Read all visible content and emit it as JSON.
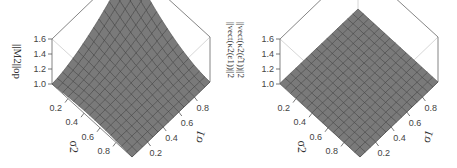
{
  "chart_data": [
    {
      "type": "surface3d",
      "title": "",
      "zlabel": "||M2||op",
      "xlabel": "σ1",
      "ylabel": "σ2",
      "x_ticks": [
        "0.2",
        "0.4",
        "0.6",
        "0.8"
      ],
      "y_ticks": [
        "0.2",
        "0.4",
        "0.6",
        "0.8"
      ],
      "z_ticks": [
        "1.0",
        "1.2",
        "1.4",
        "1.6"
      ],
      "zlim": [
        1.0,
        1.6
      ],
      "grid_size": 15,
      "description": "Surface rises to ~1.6 at corner where σ1 high and σ2 low; ~1.0 elsewhere with a saddle-like dip",
      "corner_values": {
        "s1_low_s2_low": 1.05,
        "s1_high_s2_low": 1.6,
        "s1_low_s2_high": 1.0,
        "s1_high_s2_high": 1.0
      }
    },
    {
      "type": "surface3d",
      "title": "",
      "zlabel": "||vect(κ2(ε1))||2 / ||vect(κ2(ε̂1))||2",
      "xlabel": "σ1",
      "ylabel": "σ2",
      "x_ticks": [
        "0.2",
        "0.4",
        "0.6",
        "0.8"
      ],
      "y_ticks": [
        "0.2",
        "0.4",
        "0.6",
        "0.8"
      ],
      "z_ticks": [
        "1.0",
        "1.2",
        "1.4",
        "1.6"
      ],
      "zlim": [
        1.0,
        1.6
      ],
      "grid_size": 15,
      "description": "Flat surface at ~1.0 across all σ1, σ2",
      "corner_values": {
        "s1_low_s2_low": 1.0,
        "s1_high_s2_low": 1.0,
        "s1_low_s2_high": 1.0,
        "s1_high_s2_high": 1.0
      }
    }
  ],
  "labels": {
    "left_z": "||M",
    "left_z_sub": "2",
    "left_z_end": "||op",
    "right_z_top": "||vect(κ2(ε1))||2",
    "right_z_bot": "||vect(κ2(ε̂1))||2",
    "sigma1": "σ1",
    "sigma2": "σ2"
  }
}
